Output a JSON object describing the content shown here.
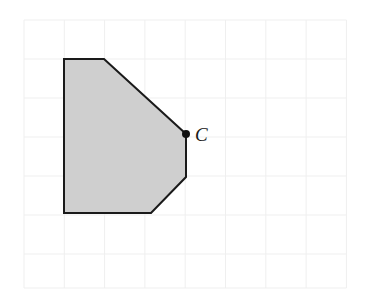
{
  "figure": {
    "name": "shaded-hexagon-on-grid",
    "type": "geometry-diagram",
    "canvas": {
      "width": 365,
      "height": 296,
      "background": "#ffffff"
    },
    "grid": {
      "visible": true,
      "line_color": "#efefef",
      "line_width": 1,
      "cell_size": 40.3,
      "origin_x": 24,
      "origin_y": 20,
      "columns": 8,
      "rows": 7,
      "x_lines": [
        24,
        64.3,
        104.6,
        144.9,
        185.2,
        225.5,
        265.8,
        306.1,
        346.4
      ],
      "y_lines": [
        20,
        59,
        98,
        137,
        176,
        215,
        254,
        288
      ]
    },
    "shape": {
      "name": "shaded-polygon",
      "fill_color": "#cfcfcf",
      "stroke_color": "#1a1a1a",
      "stroke_width": 2,
      "vertices": [
        {
          "x": 64,
          "y": 59
        },
        {
          "x": 104,
          "y": 59
        },
        {
          "x": 186,
          "y": 134
        },
        {
          "x": 186,
          "y": 177
        },
        {
          "x": 151,
          "y": 213
        },
        {
          "x": 64,
          "y": 213
        }
      ],
      "points_path": "64,59 104,59 186,134 186,177 151,213 64,213"
    },
    "marked_point": {
      "name": "point-c",
      "label": "C",
      "x": 186,
      "y": 134,
      "radius": 4,
      "color": "#111111",
      "label_x": 195,
      "label_y": 141
    }
  }
}
